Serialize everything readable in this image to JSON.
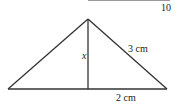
{
  "page_number": "10",
  "diagram": {
    "type": "isosceles-triangle-with-altitude",
    "labels": {
      "height": "x",
      "slant_side": "3 cm",
      "half_base": "2 cm"
    },
    "colors": {
      "stroke": "#333333",
      "text": "#222222"
    }
  }
}
